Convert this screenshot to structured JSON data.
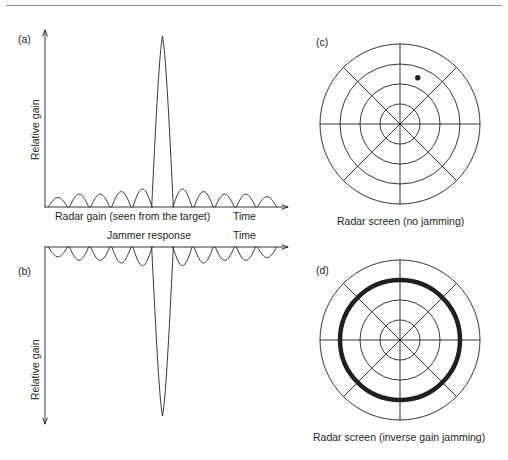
{
  "figure": {
    "width": 508,
    "height": 460,
    "background": "#ffffff",
    "line_color": "#231f20",
    "rule_color": "#8a8a8a"
  },
  "panels": {
    "a": {
      "tag": "(a)",
      "y_axis_label": "Relative gain",
      "x_axis_caption": "Radar gain (seen from the target)",
      "time_label": "Time",
      "orientation": "main lobe up"
    },
    "b": {
      "tag": "(b)",
      "y_axis_label": "Relative gain",
      "x_axis_caption": "Jammer response",
      "time_label": "Time",
      "orientation": "main lobe down (inverted)"
    },
    "c": {
      "tag": "(c)",
      "caption": "Radar screen (no jamming)",
      "rings": 4,
      "spokes": 8,
      "target_blip": true
    },
    "d": {
      "tag": "(d)",
      "caption": "Radar screen (inverse gain jamming)",
      "rings": 4,
      "spokes": 8,
      "target_blip": false,
      "jamming_ring_index": 3
    }
  },
  "chart_data": [
    {
      "type": "line",
      "id": "panel-a",
      "title": "Radar gain (seen from the target)",
      "xlabel": "Time",
      "ylabel": "Relative gain",
      "description": "Antenna gain pattern versus time: one tall narrow main lobe with small sidelobes on each side, drawn upward from a baseline.",
      "baseline": 0,
      "main_lobe": {
        "center": 0.5,
        "half_width": 0.046,
        "height": 1.0
      },
      "sidelobes_left": [
        {
          "center": 0.055,
          "half_width": 0.041,
          "height": 0.055
        },
        {
          "center": 0.145,
          "half_width": 0.041,
          "height": 0.075
        },
        {
          "center": 0.235,
          "half_width": 0.041,
          "height": 0.075
        },
        {
          "center": 0.325,
          "half_width": 0.041,
          "height": 0.09
        },
        {
          "center": 0.415,
          "half_width": 0.041,
          "height": 0.105
        }
      ],
      "sidelobes_right": [
        {
          "center": 0.585,
          "half_width": 0.041,
          "height": 0.105
        },
        {
          "center": 0.675,
          "half_width": 0.041,
          "height": 0.09
        },
        {
          "center": 0.765,
          "half_width": 0.041,
          "height": 0.075
        },
        {
          "center": 0.855,
          "half_width": 0.041,
          "height": 0.075
        },
        {
          "center": 0.945,
          "half_width": 0.041,
          "height": 0.06
        }
      ],
      "grid": false,
      "legend": "none"
    },
    {
      "type": "line",
      "id": "panel-b",
      "title": "Jammer response",
      "xlabel": "Time",
      "ylabel": "Relative gain",
      "description": "Inverse of the radar gain pattern: one very deep narrow null where the radar main lobe occurs, with small inverted lobes elsewhere, drawn downward from a top baseline.",
      "baseline": 1,
      "main_lobe": {
        "center": 0.5,
        "half_width": 0.046,
        "depth": 1.0
      },
      "sidelobes_left": [
        {
          "center": 0.055,
          "half_width": 0.041,
          "depth": 0.055
        },
        {
          "center": 0.145,
          "half_width": 0.041,
          "depth": 0.075
        },
        {
          "center": 0.235,
          "half_width": 0.041,
          "depth": 0.075
        },
        {
          "center": 0.325,
          "half_width": 0.041,
          "depth": 0.09
        },
        {
          "center": 0.415,
          "half_width": 0.041,
          "depth": 0.105
        }
      ],
      "sidelobes_right": [
        {
          "center": 0.585,
          "half_width": 0.041,
          "depth": 0.105
        },
        {
          "center": 0.675,
          "half_width": 0.041,
          "depth": 0.09
        },
        {
          "center": 0.765,
          "half_width": 0.041,
          "depth": 0.075
        },
        {
          "center": 0.855,
          "half_width": 0.041,
          "depth": 0.075
        },
        {
          "center": 0.945,
          "half_width": 0.041,
          "depth": 0.06
        }
      ],
      "grid": false,
      "legend": "none"
    },
    {
      "type": "scatter",
      "id": "panel-c",
      "title": "Radar screen (no jamming)",
      "description": "PPI radar display with 4 range rings and 8 azimuth spokes; one small target blip in the upper-right quadrant.",
      "ring_radii_px": [
        20,
        40,
        60,
        80
      ],
      "spoke_angles_deg": [
        0,
        45,
        90,
        135,
        180,
        225,
        270,
        315
      ],
      "points": [
        {
          "r_fraction": 0.62,
          "angle_deg": 69,
          "label": "target blip"
        }
      ],
      "grid": true,
      "legend": "none"
    },
    {
      "type": "scatter",
      "id": "panel-d",
      "title": "Radar screen (inverse gain jamming)",
      "description": "PPI radar display with 4 range rings and 8 azimuth spokes; the third range ring is drawn as a heavy black band representing a jamming ring that masks the target.",
      "ring_radii_px": [
        20,
        40,
        60,
        80
      ],
      "spoke_angles_deg": [
        0,
        45,
        90,
        135,
        180,
        225,
        270,
        315
      ],
      "jamming_ring_radius_px": 60,
      "jamming_ring_thickness_px": 4.5,
      "points": [],
      "grid": true,
      "legend": "none"
    }
  ]
}
